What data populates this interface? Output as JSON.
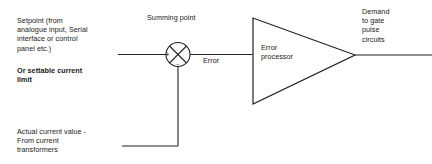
{
  "diagram": {
    "background_color": "#ffffff",
    "line_color": "#222222",
    "text_color": "#1a1a1a",
    "labels": {
      "setpoint": "Setpoint (from\nanalogue input, Serial\ninterface or control\npanel etc.)",
      "settable_limit": "Or settable current\nlimit",
      "actual_current": "Actual current value -\nFrom current\ntransformers",
      "summing_point": "Summing point",
      "error": "Error",
      "error_processor": "Error\nprocessor",
      "demand": "Demand\nto gate\npulse\ncircuits"
    },
    "summing_point": {
      "plus_sign": "+",
      "minus_sign": "-",
      "shape": "circle-with-cross"
    },
    "error_processor": {
      "shape": "triangle-amplifier"
    }
  }
}
